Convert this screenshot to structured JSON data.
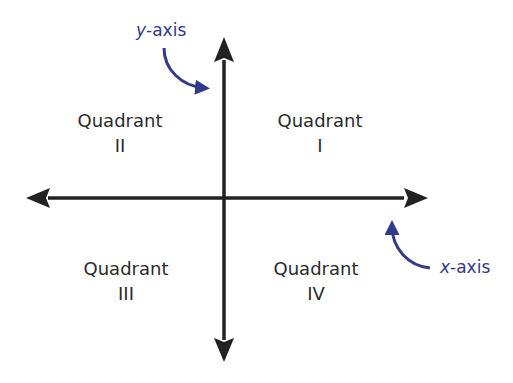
{
  "diagram": {
    "colors": {
      "axis": "#222222",
      "annotation": "#333a8a",
      "text": "#2b2b2b",
      "background": "#ffffff"
    },
    "axes": {
      "x_axis": {
        "label_var": "x",
        "label_suffix": "-axis",
        "arrows": [
          "left",
          "right"
        ]
      },
      "y_axis": {
        "label_var": "y",
        "label_suffix": "-axis",
        "arrows": [
          "up",
          "down"
        ]
      }
    },
    "quadrants": [
      {
        "id": "I",
        "word": "Quadrant",
        "numeral": "I",
        "position": "top-right"
      },
      {
        "id": "II",
        "word": "Quadrant",
        "numeral": "II",
        "position": "top-left"
      },
      {
        "id": "III",
        "word": "Quadrant",
        "numeral": "III",
        "position": "bottom-left"
      },
      {
        "id": "IV",
        "word": "Quadrant",
        "numeral": "IV",
        "position": "bottom-right"
      }
    ]
  }
}
